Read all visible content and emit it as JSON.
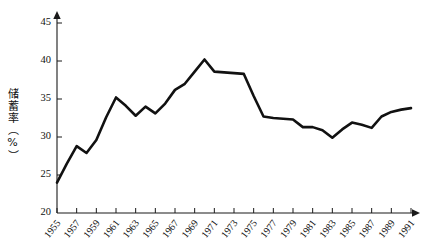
{
  "chart_data": {
    "type": "line",
    "title": "",
    "subtitle": "",
    "xlabel": "",
    "ylabel": "储蓄率（%）",
    "ylabel_icon": "vertical-axis-title",
    "xlim": [
      1955,
      1991
    ],
    "ylim": [
      20,
      46
    ],
    "grid": false,
    "legend": false,
    "legend_position": "none",
    "series_color": "#111111",
    "axis_color": "#1a1a1a",
    "y_ticks": [
      20,
      25,
      30,
      35,
      40,
      45
    ],
    "y_tick_labels": [
      "20",
      "25",
      "30",
      "35",
      "40",
      "45"
    ],
    "x_ticks": [
      1955,
      1957,
      1959,
      1961,
      1963,
      1965,
      1967,
      1969,
      1971,
      1973,
      1975,
      1977,
      1979,
      1981,
      1983,
      1985,
      1987,
      1989,
      1991
    ],
    "x_tick_labels": [
      "1955",
      "1957",
      "1959",
      "1961",
      "1963",
      "1965",
      "1967",
      "1969",
      "1971",
      "1973",
      "1975",
      "1977",
      "1979",
      "1981",
      "1983",
      "1985",
      "1987",
      "1989",
      "1991"
    ],
    "x": [
      1955,
      1956,
      1957,
      1958,
      1959,
      1960,
      1961,
      1962,
      1963,
      1964,
      1965,
      1966,
      1967,
      1968,
      1969,
      1970,
      1971,
      1972,
      1973,
      1974,
      1975,
      1976,
      1977,
      1978,
      1979,
      1980,
      1981,
      1982,
      1983,
      1984,
      1985,
      1986,
      1987,
      1988,
      1989,
      1990,
      1991
    ],
    "values": [
      24.0,
      26.5,
      28.8,
      27.9,
      29.6,
      32.6,
      35.2,
      34.1,
      32.8,
      34.0,
      33.1,
      34.4,
      36.2,
      37.0,
      38.6,
      40.2,
      38.6,
      38.5,
      38.4,
      38.3,
      35.4,
      32.7,
      32.5,
      32.4,
      32.3,
      31.3,
      31.3,
      30.9,
      29.9,
      31.0,
      31.9,
      31.6,
      31.2,
      32.7,
      33.3,
      33.6,
      33.8
    ],
    "series_name": "储蓄率"
  },
  "axis": {
    "y_arrow": "up-arrow",
    "x_arrow": "right-arrow"
  }
}
